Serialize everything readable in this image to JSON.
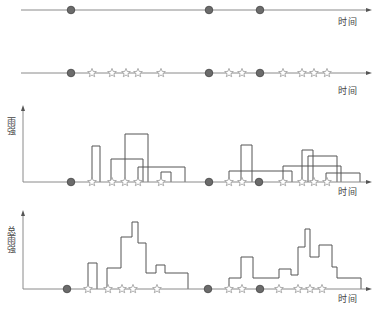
{
  "labels": {
    "time": "时间",
    "rain_intensity": "雨强",
    "total_rain_intensity": "总雨强"
  },
  "colors": {
    "axis": "#8a8a8a",
    "circle_fill": "#6b6b6b",
    "circle_stroke": "#444444",
    "star_stroke": "#9a9a9a",
    "bar_stroke": "#555555"
  },
  "chart_data": {
    "type": "diagram",
    "panels": [
      {
        "name": "panel-events",
        "axis_y": 10,
        "axis_x_start": 21,
        "axis_x_end": 372,
        "has_y_axis": false,
        "circles": [
          71,
          209,
          260
        ],
        "stars": [],
        "x_label": {
          "text_key": "time",
          "x": 338,
          "y": 18
        }
      },
      {
        "name": "panel-events-with-stars",
        "axis_y": 73,
        "axis_x_start": 21,
        "axis_x_end": 372,
        "has_y_axis": false,
        "circles": [
          71,
          209,
          260
        ],
        "stars": [
          92,
          112,
          126,
          138,
          161,
          229,
          242,
          283,
          302,
          314,
          327
        ],
        "x_label": {
          "text_key": "time",
          "x": 338,
          "y": 87
        }
      },
      {
        "name": "panel-rain-intensity",
        "axis_y": 182,
        "axis_x_start": 23,
        "axis_x_end": 372,
        "has_y_axis": true,
        "y_axis_top": 105,
        "y_label": {
          "text_key": "rain_intensity",
          "x": 6,
          "y": 117
        },
        "circles": [
          71,
          209,
          259
        ],
        "stars": [
          92,
          112,
          125,
          138,
          161,
          229,
          242,
          283,
          302,
          314,
          327
        ],
        "rects": [
          [
            92,
            100,
            146
          ],
          [
            111,
            143,
            159
          ],
          [
            125,
            148,
            134
          ],
          [
            138,
            185,
            167
          ],
          [
            161,
            171,
            172
          ],
          [
            229,
            292,
            171
          ],
          [
            241,
            252,
            145
          ],
          [
            283,
            341,
            166
          ],
          [
            302,
            313,
            150
          ],
          [
            308,
            337,
            156
          ],
          [
            326,
            360,
            173
          ]
        ],
        "x_label": {
          "text_key": "time",
          "x": 338,
          "y": 188
        }
      },
      {
        "name": "panel-total-rain-intensity",
        "axis_y": 289,
        "axis_x_start": 23,
        "axis_x_end": 372,
        "has_y_axis": true,
        "y_axis_top": 210,
        "y_label": {
          "text_key": "total_rain_intensity",
          "x": 6,
          "y": 226
        },
        "circles": [
          67,
          208,
          260
        ],
        "stars": [
          88,
          108,
          122,
          133,
          157,
          229,
          242,
          279,
          298,
          310,
          322
        ],
        "steps": [
          [
            [
              88,
              289
            ],
            [
              88,
              263
            ],
            [
              97,
              263
            ],
            [
              97,
              289
            ]
          ],
          [
            [
              107,
              289
            ],
            [
              107,
              268
            ],
            [
              121,
              268
            ],
            [
              121,
              237
            ],
            [
              132,
              237
            ],
            [
              132,
              222
            ],
            [
              138,
              222
            ],
            [
              138,
              243
            ],
            [
              146,
              243
            ],
            [
              146,
              273
            ],
            [
              156,
              273
            ],
            [
              156,
              265
            ],
            [
              165,
              265
            ],
            [
              165,
              273
            ],
            [
              188,
              273
            ],
            [
              188,
              289
            ]
          ],
          [
            [
              229,
              289
            ],
            [
              229,
              278
            ],
            [
              241,
              278
            ],
            [
              241,
              257
            ],
            [
              253,
              257
            ],
            [
              253,
              278
            ],
            [
              279,
              278
            ],
            [
              279,
              269
            ],
            [
              291,
              269
            ],
            [
              291,
              275
            ],
            [
              298,
              275
            ],
            [
              298,
              247
            ],
            [
              305,
              247
            ],
            [
              305,
              229
            ],
            [
              310,
              229
            ],
            [
              310,
              257
            ],
            [
              319,
              257
            ],
            [
              319,
              245
            ],
            [
              332,
              245
            ],
            [
              332,
              267
            ],
            [
              337,
              267
            ],
            [
              337,
              278
            ],
            [
              361,
              278
            ],
            [
              361,
              289
            ]
          ]
        ],
        "x_label": {
          "text_key": "time",
          "x": 338,
          "y": 295
        }
      }
    ]
  }
}
